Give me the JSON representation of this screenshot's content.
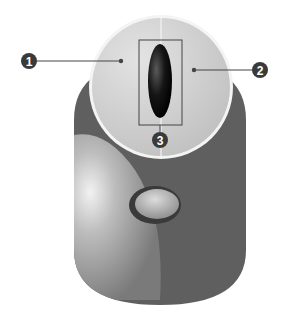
{
  "diagram": {
    "colors": {
      "body": "#5f5f5f",
      "body_highlight": "#b9b9b9",
      "top": "#cfcfcf",
      "top_rim": "#f4f4f4",
      "wheel": "#111111",
      "callout": "#3a3a3a"
    },
    "callouts": [
      {
        "number": "1",
        "target": "left-button"
      },
      {
        "number": "2",
        "target": "right-button"
      },
      {
        "number": "3",
        "target": "scroll-wheel"
      }
    ]
  }
}
